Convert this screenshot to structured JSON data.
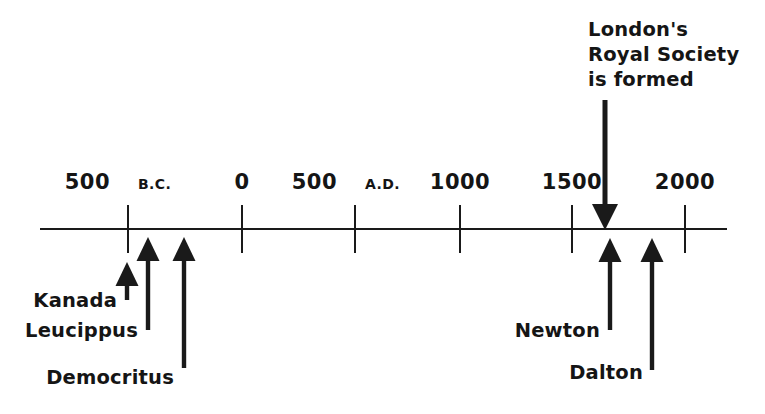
{
  "figure": {
    "background_color": "#ffffff",
    "ink_color": "#1a1a1a"
  },
  "axis": {
    "name": "timeline-axis",
    "x_start": 40,
    "x_end": 727,
    "y": 229,
    "tick_top": 205,
    "tick_bottom": 253
  },
  "chart_data": {
    "type": "timeline",
    "title": "",
    "xlabel": "",
    "ylabel": "",
    "axis_range_years": [
      -750,
      2250
    ],
    "grid": false,
    "legend": false,
    "tick_labels": [
      "500 B.C.",
      "0",
      "500 A.D.",
      "1000",
      "1500",
      "2000"
    ],
    "tick_values": [
      -500,
      0,
      500,
      1000,
      1500,
      2000
    ],
    "events": [
      {
        "label": "Kanada",
        "year": -500,
        "direction": "up"
      },
      {
        "label": "Leucippus",
        "year": -440,
        "direction": "up"
      },
      {
        "label": "Democritus",
        "year": -400,
        "direction": "up"
      },
      {
        "label": "London's Royal Society is formed",
        "year": 1660,
        "direction": "down"
      },
      {
        "label": "Newton",
        "year": 1680,
        "direction": "up"
      },
      {
        "label": "Dalton",
        "year": 1803,
        "direction": "up"
      }
    ]
  },
  "ticks": [
    {
      "name": "tick-500-bc",
      "x": 128,
      "number": "500",
      "era": "B.C.",
      "number_x": 110,
      "era_x": 138,
      "label_y": 189
    },
    {
      "name": "tick-0",
      "x": 242,
      "number": "0",
      "era": "",
      "number_x": 242,
      "era_x": 0,
      "label_y": 189
    },
    {
      "name": "tick-500-ad",
      "x": 355,
      "number": "500",
      "era": "A.D.",
      "number_x": 337,
      "era_x": 365,
      "label_y": 189
    },
    {
      "name": "tick-1000",
      "x": 460,
      "number": "1000",
      "era": "",
      "number_x": 460,
      "era_x": 0,
      "label_y": 189
    },
    {
      "name": "tick-1500",
      "x": 572,
      "number": "1500",
      "era": "",
      "number_x": 572,
      "era_x": 0,
      "label_y": 189
    },
    {
      "name": "tick-2000",
      "x": 685,
      "number": "2000",
      "era": "",
      "number_x": 685,
      "era_x": 0,
      "label_y": 189
    }
  ],
  "up_arrows": [
    {
      "name": "arrow-kanada",
      "x": 127,
      "tip_y": 262,
      "tail_y": 300
    },
    {
      "name": "arrow-leucippus",
      "x": 148,
      "tip_y": 237,
      "tail_y": 330
    },
    {
      "name": "arrow-democritus",
      "x": 184,
      "tip_y": 237,
      "tail_y": 368
    },
    {
      "name": "arrow-newton",
      "x": 610,
      "tip_y": 238,
      "tail_y": 330
    },
    {
      "name": "arrow-dalton",
      "x": 652,
      "tip_y": 238,
      "tail_y": 370
    }
  ],
  "down_arrows": [
    {
      "name": "arrow-royal-society",
      "x": 605,
      "tail_y": 100,
      "tip_y": 230
    }
  ],
  "event_labels": [
    {
      "name": "label-kanada",
      "text": "Kanada",
      "x": 117,
      "y": 307,
      "anchor": "end"
    },
    {
      "name": "label-leucippus",
      "text": "Leucippus",
      "x": 138,
      "y": 337,
      "anchor": "end"
    },
    {
      "name": "label-democritus",
      "text": "Democritus",
      "x": 174,
      "y": 384,
      "anchor": "end"
    },
    {
      "name": "label-newton",
      "text": "Newton",
      "x": 600,
      "y": 337,
      "anchor": "end"
    },
    {
      "name": "label-dalton",
      "text": "Dalton",
      "x": 643,
      "y": 379,
      "anchor": "end"
    }
  ],
  "callout": {
    "name": "callout-royal-society",
    "lines": [
      "London's",
      "Royal Society",
      "is formed"
    ],
    "x": 588,
    "line_y": [
      36,
      61,
      86
    ],
    "anchor": "start"
  }
}
